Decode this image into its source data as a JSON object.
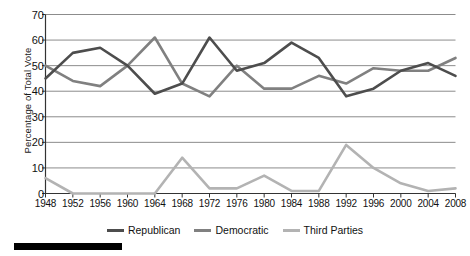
{
  "chart_data": {
    "type": "line",
    "title": "",
    "xlabel": "",
    "ylabel": "Percentage of Total Vote",
    "x": [
      1948,
      1952,
      1956,
      1960,
      1964,
      1968,
      1972,
      1976,
      1980,
      1984,
      1988,
      1992,
      1996,
      2000,
      2004,
      2008
    ],
    "xtick_labels": [
      "1948",
      "1952",
      "1956",
      "1960",
      "1964",
      "1968",
      "1972",
      "1976",
      "1980",
      "1984",
      "1988",
      "1992",
      "1996",
      "2000",
      "2004",
      "2008"
    ],
    "ytick_labels": [
      "0",
      "10",
      "20",
      "30",
      "40",
      "50",
      "60",
      "70"
    ],
    "yticks": [
      0,
      10,
      20,
      30,
      40,
      50,
      60,
      70
    ],
    "ylim": [
      0,
      70
    ],
    "xlim": [
      1948,
      2008
    ],
    "grid": "horizontal",
    "legend_position": "bottom-center",
    "series": [
      {
        "name": "Republican",
        "color": "#4d4d4d",
        "values": [
          45,
          55,
          57,
          50,
          39,
          43,
          61,
          48,
          51,
          59,
          53,
          38,
          41,
          48,
          51,
          46
        ]
      },
      {
        "name": "Democratic",
        "color": "#808080",
        "values": [
          50,
          44,
          42,
          50,
          61,
          43,
          38,
          50,
          41,
          41,
          46,
          43,
          49,
          48,
          48,
          53
        ]
      },
      {
        "name": "Third Parties",
        "color": "#b3b3b3",
        "values": [
          6,
          0,
          0,
          0,
          0,
          14,
          2,
          2,
          7,
          1,
          1,
          19,
          10,
          4,
          1,
          2
        ]
      }
    ]
  },
  "legend": {
    "items": [
      {
        "label": "Republican",
        "color": "#4d4d4d"
      },
      {
        "label": "Democratic",
        "color": "#808080"
      },
      {
        "label": "Third Parties",
        "color": "#b3b3b3"
      }
    ]
  },
  "axes": {
    "y_axis_title": "Percentage of Total Vote"
  },
  "colors": {
    "republican": "#4d4d4d",
    "democratic": "#808080",
    "third_parties": "#b3b3b3",
    "gridline": "#8c8c8c",
    "axis": "#333333",
    "footer_bar": "#000000"
  },
  "footer": {
    "bar_present": true
  }
}
